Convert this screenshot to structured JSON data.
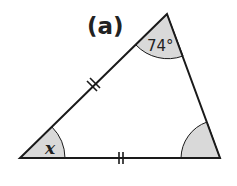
{
  "diagram": {
    "part_label": "(a)",
    "top_angle_label": "74°",
    "bottom_left_angle_label": "x",
    "colors": {
      "stroke": "#1a1a1a",
      "angle_fill": "#d9d9d9",
      "background": "#ffffff"
    },
    "vertices": {
      "top": [
        167,
        14
      ],
      "bottom_left": [
        20,
        158
      ],
      "bottom_right": [
        220,
        158
      ]
    },
    "equal_side_marks": [
      "left side (double tick)",
      "bottom side (double tick)"
    ]
  }
}
